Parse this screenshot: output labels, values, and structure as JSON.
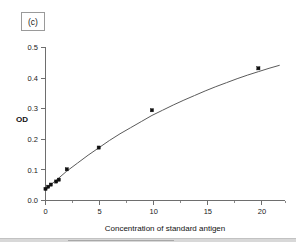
{
  "figure": {
    "panel_label": "(c)",
    "background_color": "#ffffff",
    "curve_color": "#5a5a5a",
    "point_color": "#101010",
    "axis_color": "#6e6e6e"
  },
  "chart_data": {
    "type": "scatter",
    "title": "",
    "subtitle": "",
    "panel": "(c)",
    "xlabel": "Concentration of standard antigen",
    "ylabel": "OD",
    "xlim": [
      0,
      22.5
    ],
    "ylim": [
      0.0,
      0.5
    ],
    "xticks": [
      0,
      5,
      10,
      15,
      20
    ],
    "xticklabels": [
      "0",
      "5",
      "10",
      "15",
      "20"
    ],
    "xticks_minor": [
      2.5,
      7.5,
      12.5,
      17.5,
      22.5
    ],
    "yticks": [
      0.0,
      0.1,
      0.2,
      0.3,
      0.4,
      0.5
    ],
    "yticklabels": [
      "0.0",
      "0.1",
      "0.2",
      "0.3",
      "0.4",
      "0.5"
    ],
    "grid": false,
    "legend": false,
    "legend_position": "none",
    "series": [
      {
        "name": "standard curve data points",
        "marker": "square",
        "x": [
          0,
          0.25,
          0.5,
          1.0,
          1.25,
          2.0,
          5.0,
          10.0,
          20.0
        ],
        "values": [
          0.038,
          0.045,
          0.052,
          0.062,
          0.068,
          0.102,
          0.173,
          0.295,
          0.432
        ]
      },
      {
        "name": "fitted saturation curve",
        "marker": "none",
        "line": "solid",
        "x": [
          0,
          0.5,
          1,
          2,
          3,
          4,
          5,
          6,
          7,
          8,
          9,
          10,
          11,
          12,
          13,
          14,
          15,
          16,
          17,
          18,
          19,
          20,
          21,
          22
        ],
        "values": [
          0.035,
          0.052,
          0.066,
          0.096,
          0.122,
          0.148,
          0.172,
          0.196,
          0.218,
          0.238,
          0.258,
          0.278,
          0.295,
          0.312,
          0.328,
          0.343,
          0.358,
          0.372,
          0.385,
          0.398,
          0.41,
          0.421,
          0.432,
          0.442
        ]
      }
    ]
  }
}
